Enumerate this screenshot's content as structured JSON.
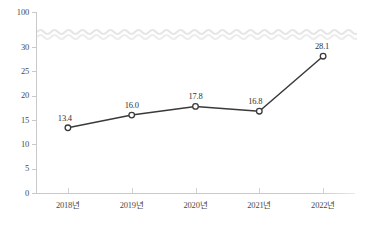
{
  "chart_data": {
    "type": "line",
    "title": "",
    "subtitle": "",
    "xlabel": "",
    "ylabel": "",
    "categories": [
      "2018년",
      "2019년",
      "2020년",
      "2021년",
      "2022년"
    ],
    "values": [
      13.4,
      16.0,
      17.8,
      16.8,
      28.1
    ],
    "point_labels": [
      "13.4",
      "16.0",
      "17.8",
      "16.8",
      "28.1"
    ],
    "series": [
      {
        "name": "",
        "values": [
          13.4,
          16.0,
          17.8,
          16.8,
          28.1
        ]
      }
    ],
    "ylim": [
      0,
      100
    ],
    "ytick_labels": [
      "0",
      "5",
      "10",
      "15",
      "20",
      "25",
      "30",
      "100"
    ],
    "ytick_values": [
      0,
      5,
      10,
      15,
      20,
      25,
      30,
      100
    ],
    "axis_break": {
      "present": true,
      "style": "wavy",
      "between": [
        30,
        100
      ]
    },
    "grid": false,
    "legend": false,
    "legend_position": "none",
    "marker": "open-circle",
    "line_color": "#3a3a3a",
    "marker_fill": "#ffffff",
    "axis_color": "#c9c9c9",
    "text_color": "#4a4a4a",
    "break_color": "#e4e4e4",
    "background": "#ffffff"
  }
}
